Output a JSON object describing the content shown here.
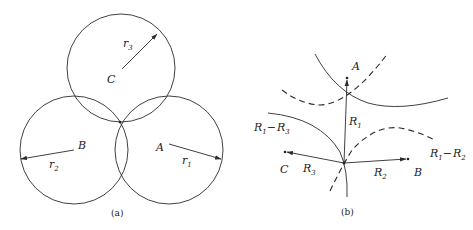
{
  "panel_a": {
    "caption": "(a)",
    "circles": [
      {
        "name": "C",
        "center_label": "C",
        "radius_label": "r",
        "radius_sub": "3"
      },
      {
        "name": "B",
        "center_label": "B",
        "radius_label": "r",
        "radius_sub": "2"
      },
      {
        "name": "A",
        "center_label": "A",
        "radius_label": "r",
        "radius_sub": "1"
      }
    ]
  },
  "panel_b": {
    "caption": "(b)",
    "points": {
      "A": "A",
      "B": "B",
      "C": "C"
    },
    "vectors": [
      {
        "label": "R",
        "sub": "1"
      },
      {
        "label": "R",
        "sub": "2"
      },
      {
        "label": "R",
        "sub": "3"
      }
    ],
    "hyperbola_labels": [
      {
        "label_main": "R",
        "sub1": "1",
        "minus": "−",
        "label_main2": "R",
        "sub2": "3"
      },
      {
        "label_main": "R",
        "sub1": "1",
        "minus": "−",
        "label_main2": "R",
        "sub2": "2"
      }
    ]
  }
}
